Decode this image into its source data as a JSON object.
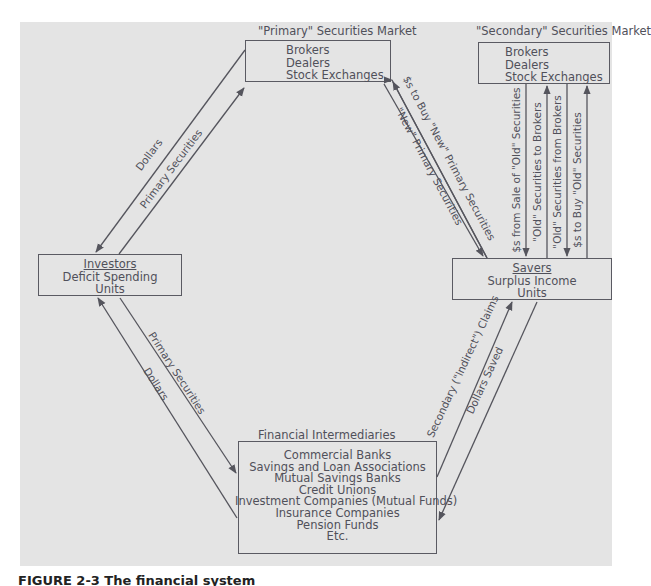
{
  "diagram": {
    "nodes": {
      "primary_market": {
        "title": "\"Primary\" Securities Market",
        "lines": [
          "Brokers",
          "Dealers",
          "Stock Exchanges"
        ]
      },
      "secondary_market": {
        "title": "\"Secondary\" Securities Market",
        "lines": [
          "Brokers",
          "Dealers",
          "Stock Exchanges"
        ]
      },
      "investors": {
        "heading": "Investors",
        "lines": [
          "Deficit Spending",
          "Units"
        ]
      },
      "savers": {
        "heading": "Savers",
        "lines": [
          "Surplus Income",
          "Units"
        ]
      },
      "intermediaries": {
        "title": "Financial Intermediaries",
        "lines": [
          "Commercial Banks",
          "Savings and Loan Associations",
          "Mutual Savings Banks",
          "Credit Unions",
          "Investment Companies (Mutual Funds)",
          "Insurance Companies",
          "Pension Funds",
          "Etc."
        ]
      }
    },
    "edges": {
      "investors_primary_dollars": "Dollars",
      "investors_primary_securities": "Primary Securities",
      "savers_primary_dollars": "$s to Buy \"New\" Primary Securities",
      "savers_primary_securities": "\"New\" Primary Securities",
      "sec_sale_proceeds": "$s from Sale of \"Old\" Securities",
      "sec_old_to_brokers": "\"Old\" Securities to Brokers",
      "sec_old_from_brokers": "\"Old\" Securities from Brokers",
      "sec_dollars_to_buy": "$s to Buy \"Old\" Securities",
      "investors_fi_securities": "Primary Securities",
      "investors_fi_dollars": "Dollars",
      "savers_fi_claims": "Secondary (\"Indirect\") Claims",
      "savers_fi_dollars": "Dollars Saved"
    }
  },
  "caption": "FIGURE 2-3  The financial system"
}
